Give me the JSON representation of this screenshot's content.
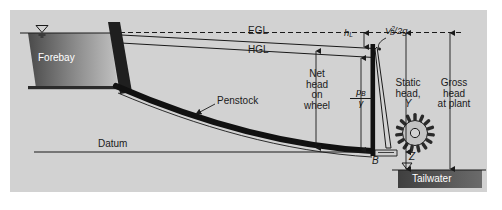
{
  "figure": {
    "type": "engineering-diagram",
    "panel_color": "#d2d2d2",
    "background_color": "#ffffff",
    "ink_color": "#1a1a1a"
  },
  "labels": {
    "forebay": "Forebay",
    "egl": "EGL",
    "hgl": "HGL",
    "head_loss": {
      "symbol": "h",
      "sub": "L"
    },
    "velocity_head": {
      "v": "V",
      "sub": "B",
      "sup": "2",
      "rest": "/2g"
    },
    "net_head": {
      "line1": "Net",
      "line2": "head",
      "line3": "on",
      "line4": "wheel"
    },
    "pressure_head": {
      "num_main": "p",
      "num_sub": "B",
      "den": "γ"
    },
    "static_head": {
      "line1": "Static",
      "line2": "head,",
      "line3": "Y"
    },
    "gross_head": {
      "line1": "Gross",
      "line2": "head",
      "line3": "at plant"
    },
    "penstock": "Penstock",
    "datum": "Datum",
    "point_b": "B",
    "elevation_z": "Z",
    "tailwater": "Tailwater"
  },
  "colors": {
    "forebay_dark": "#4f4f4f",
    "forebay_light": "#bdbdbd",
    "tailwater_dark": "#4a4a4a",
    "line": "#1a1a1a",
    "panel": "#d2d2d2"
  },
  "geometry": {
    "forebay_water_level_y": 33,
    "egl_start_y": 34,
    "egl_end_y": 48,
    "hgl_start_y": 42,
    "hgl_end_y": 57,
    "datum_y": 152,
    "point_b_x": 373,
    "tailwater_surface_y": 170
  }
}
